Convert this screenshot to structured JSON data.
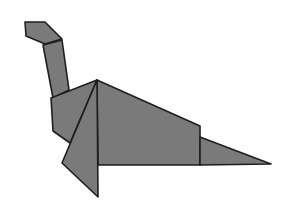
{
  "figure": {
    "subject": "origami dinosaur",
    "colors": {
      "background": "#ffffff",
      "fill": "#7a7a7a",
      "stroke": "#1e1e1e"
    },
    "pieces": [
      {
        "name": "head",
        "points": "25,22 45,22 62,39 45,44 26,36"
      },
      {
        "name": "neck",
        "points": "43,45 62,40 69,90 53,98"
      },
      {
        "name": "chest",
        "points": "51,98 97,80 70,143 53,131"
      },
      {
        "name": "body",
        "points": "97,80 200,126 200,165 98,165"
      },
      {
        "name": "tail",
        "points": "200,137 271,164 200,165"
      },
      {
        "name": "front-leg",
        "points": "97,80 98,197 62,163"
      }
    ]
  }
}
